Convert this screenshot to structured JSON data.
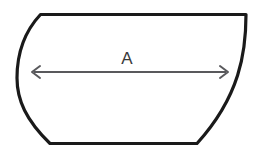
{
  "figure": {
    "background_color": "#ffffff",
    "width": 263,
    "height": 154,
    "outline": {
      "name": "rounded-trapezoid-outline",
      "stroke_color": "#1a1a1a",
      "stroke_width": 3.2,
      "fill_color": "#ffffff",
      "path": "M 40.5 14.5 L 246 14.5 C 246 52 240 96 197 143.5 L 50 143.5 C 26 120 17 100 17 78 C 17 52 26 30 40.5 14.5 Z",
      "vertices": {
        "top_left": [
          40.5,
          14.5
        ],
        "top_right": [
          246,
          14.5
        ],
        "bottom_right": [
          197,
          143.5
        ],
        "bottom_left": [
          50,
          143.5
        ],
        "left_extreme": [
          17,
          78
        ]
      }
    },
    "dimension": {
      "name": "dimension-a",
      "label": "A",
      "label_x": 127,
      "label_y": 64,
      "label_color": "#3a3a3a",
      "line_color": "#59595c",
      "line_width": 2,
      "axis_y": 72,
      "x_start": 32,
      "x_end": 228,
      "arrowhead_size": 7,
      "arrowheads": "both"
    }
  }
}
